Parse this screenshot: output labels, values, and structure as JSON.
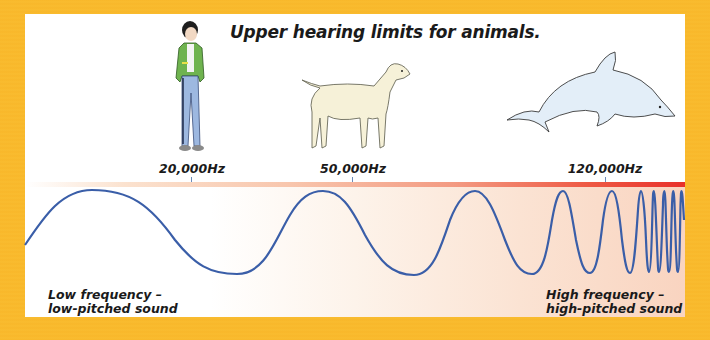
{
  "title": "Upper hearing limits for animals.",
  "animals": [
    {
      "name": "human (boy)",
      "limit_label": "20,000Hz",
      "limit_hz": 20000
    },
    {
      "name": "dog",
      "limit_label": "50,000Hz",
      "limit_hz": 50000
    },
    {
      "name": "dolphin",
      "limit_label": "120,000Hz",
      "limit_hz": 120000
    }
  ],
  "captions": {
    "low_line1": "Low frequency –",
    "low_line2": "low-pitched sound",
    "high_line1": "High frequency –",
    "high_line2": "high-pitched sound"
  },
  "colors": {
    "frame": "#f9b92c",
    "wave": "#3a5ea8",
    "bar_end": "#e8302a",
    "bg_right": "#f9d4c0"
  }
}
